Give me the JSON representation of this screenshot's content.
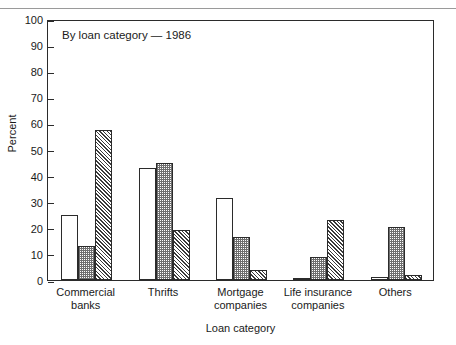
{
  "chart_data": {
    "type": "bar",
    "title": "",
    "annotation": "By loan category — 1986",
    "xlabel": "Loan category",
    "ylabel": "Percent",
    "ylim": [
      0,
      100
    ],
    "yticks": [
      0,
      10,
      20,
      30,
      40,
      50,
      60,
      70,
      80,
      90,
      100
    ],
    "ytick_labels": [
      "0",
      "10",
      "20",
      "30",
      "40",
      "50",
      "60",
      "70",
      "80",
      "90",
      "100"
    ],
    "grid": false,
    "legend": "none",
    "categories": [
      "Commercial banks",
      "Thrifts",
      "Mortgage companies",
      "Life insurance companies",
      "Others"
    ],
    "category_lines": [
      [
        "Commercial",
        "banks"
      ],
      [
        "Thrifts",
        ""
      ],
      [
        "Mortgage",
        "companies"
      ],
      [
        "Life insurance",
        "companies"
      ],
      [
        "Others",
        ""
      ]
    ],
    "series": [
      {
        "name": "series-1",
        "fill": "open",
        "values": [
          25,
          43,
          31.5,
          0.7,
          1
        ]
      },
      {
        "name": "series-2",
        "fill": "dotted",
        "values": [
          13,
          45,
          16.5,
          9,
          20.3
        ]
      },
      {
        "name": "series-3",
        "fill": "hatched",
        "values": [
          57.5,
          19,
          4,
          23,
          2
        ]
      }
    ],
    "colors": {
      "axis": "#2b2b2b",
      "text": "#1a1a1a",
      "open_fill": "#ffffff",
      "dotted_fill": "#6e6e6e",
      "hatched_fill": "#3a3a3a",
      "background": "#ffffff",
      "rule": "#9a9a9a"
    }
  }
}
